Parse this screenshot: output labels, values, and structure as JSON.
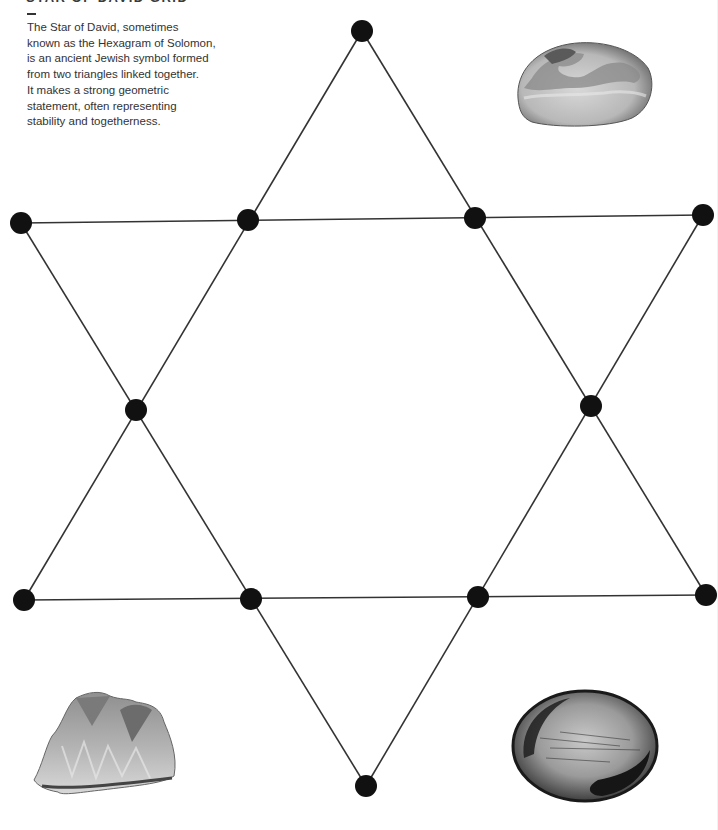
{
  "header": {
    "title": "STAR OF DAVID GRID",
    "title_partially_visible": true,
    "divider": "—",
    "description_lines": [
      "The Star of David, sometimes",
      "known as the Hexagram of Solomon,",
      "is an ancient Jewish symbol formed",
      "from two triangles linked together.",
      "It makes a strong geometric",
      "statement, often representing",
      "stability and togetherness."
    ]
  },
  "grid": {
    "node_color": "#111111",
    "line_color": "#333333",
    "nodes": [
      {
        "id": "top",
        "x": 362,
        "y": 31
      },
      {
        "id": "upper-left-outer",
        "x": 21,
        "y": 223
      },
      {
        "id": "upper-left-inner",
        "x": 248,
        "y": 220
      },
      {
        "id": "upper-right-inner",
        "x": 475,
        "y": 218
      },
      {
        "id": "upper-right-outer",
        "x": 703,
        "y": 215
      },
      {
        "id": "mid-left",
        "x": 136,
        "y": 410
      },
      {
        "id": "mid-right",
        "x": 591,
        "y": 406
      },
      {
        "id": "lower-left-outer",
        "x": 24,
        "y": 600
      },
      {
        "id": "lower-left-inner",
        "x": 251,
        "y": 599
      },
      {
        "id": "lower-right-inner",
        "x": 478,
        "y": 597
      },
      {
        "id": "lower-right-outer",
        "x": 706,
        "y": 595
      },
      {
        "id": "bottom",
        "x": 366,
        "y": 786
      }
    ],
    "triangles": [
      {
        "name": "upward-triangle",
        "points": [
          "top",
          "lower-left-outer",
          "lower-right-outer"
        ]
      },
      {
        "name": "downward-triangle",
        "points": [
          "upper-left-outer",
          "upper-right-outer",
          "bottom"
        ]
      }
    ]
  },
  "stones": [
    {
      "name": "banded-tumbled-stone",
      "position": "top-right"
    },
    {
      "name": "crystal-cluster",
      "position": "bottom-left"
    },
    {
      "name": "hematite-tumbled-stone",
      "position": "bottom-right"
    }
  ]
}
